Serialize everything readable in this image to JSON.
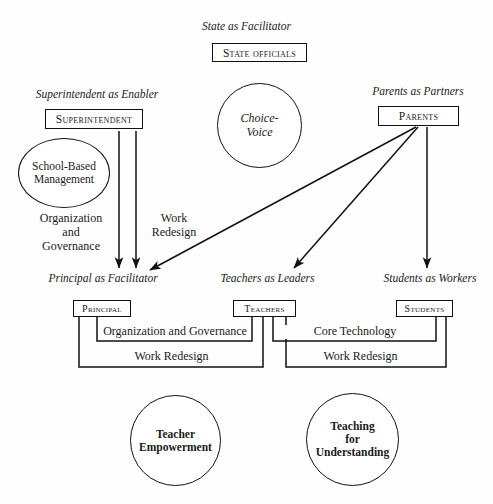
{
  "diagram": {
    "title_text": "",
    "colors": {
      "stroke": "#111111",
      "text": "#1a1a1a",
      "background": "#fefefe"
    },
    "captions": {
      "state": "State as Facilitator",
      "superintendent": "Superintendent as Enabler",
      "parents": "Parents as Partners",
      "principal": "Principal as Facilitator",
      "teachers": "Teachers as Leaders",
      "students": "Students as Workers"
    },
    "boxes": {
      "state_officials": "State officials",
      "superintendent": "Superintendent",
      "parents": "Parents",
      "principal": "Principal",
      "teachers": "Teachers",
      "students": "Students"
    },
    "circles": {
      "choice_voice_line1": "Choice-",
      "choice_voice_line2": "Voice",
      "sbm_line1": "School-Based",
      "sbm_line2": "Management",
      "teacher_empowerment_line1": "Teacher",
      "teacher_empowerment_line2": "Empowerment",
      "teaching_understanding_line1": "Teaching",
      "teaching_understanding_line2": "for",
      "teaching_understanding_line3": "Understanding"
    },
    "edge_labels": {
      "org_gov_vertical_line1": "Organization",
      "org_gov_vertical_line2": "and",
      "org_gov_vertical_line3": "Governance",
      "work_redesign_vertical_line1": "Work",
      "work_redesign_vertical_line2": "Redesign",
      "org_and_governance": "Organization and Governance",
      "work_redesign_left": "Work Redesign",
      "core_technology": "Core Technology",
      "work_redesign_right": "Work Redesign"
    }
  }
}
